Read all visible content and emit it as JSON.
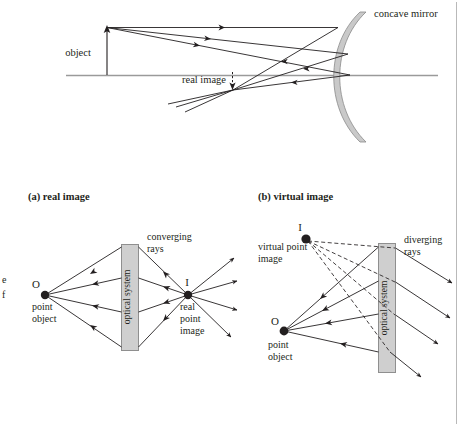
{
  "figure": {
    "top_diagram": {
      "name": "concave-mirror-real-image",
      "labels": {
        "mirror": "concave mirror",
        "object": "object",
        "real_image": "real image"
      }
    },
    "captions": {
      "a": "(a) real image",
      "b": "(b) virtual image"
    },
    "panel_a": {
      "name": "real-image-point-object",
      "labels": {
        "O": "O",
        "object_line1": "point",
        "object_line2": "object",
        "optical_system": "optical system",
        "converging_line1": "converging",
        "converging_line2": "rays",
        "I": "I",
        "image_line1": "real",
        "image_line2": "point",
        "image_line3": "image"
      }
    },
    "panel_b": {
      "name": "virtual-image-point-object",
      "labels": {
        "I": "I",
        "virtual_line1": "virtual point",
        "virtual_line2": "image",
        "optical_system": "optical system",
        "diverging_line1": "diverging",
        "diverging_line2": "rays",
        "O": "O",
        "object_line1": "point",
        "object_line2": "object"
      }
    },
    "margin_fragments": {
      "frag1": "e",
      "frag2": "f"
    },
    "colors": {
      "ink": "#231f20",
      "axis_gray": "#9a9a9a",
      "mirror_fill": "#c9c9c9",
      "mirror_stroke": "#8a8a8a",
      "box_fill": "#cfcfcf",
      "box_stroke": "#8f8f8f",
      "border": "#b9b9b9"
    }
  }
}
